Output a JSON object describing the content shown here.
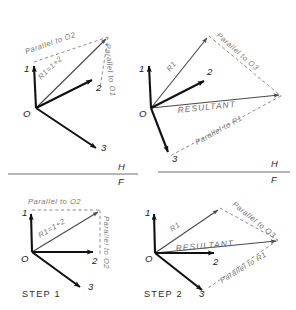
{
  "figure": {
    "panels": [
      {
        "id": "top-left",
        "name": "panel-top-left",
        "origin_label": "O",
        "vectors": [
          {
            "name": "vector-1",
            "label": "1"
          },
          {
            "name": "vector-2",
            "label": "2"
          },
          {
            "name": "vector-3",
            "label": "3"
          }
        ],
        "resultant_label": "R1=1+2",
        "construction_labels": [
          {
            "name": "parallel-to-o2",
            "text": "Parallel to  O2"
          },
          {
            "name": "parallel-to-o1",
            "text": "Parallel to O1"
          }
        ],
        "step_label": ""
      },
      {
        "id": "top-right",
        "name": "panel-top-right",
        "origin_label": "O",
        "vectors": [
          {
            "name": "vector-1",
            "label": "1"
          },
          {
            "name": "vector-2",
            "label": "2"
          },
          {
            "name": "vector-3",
            "label": "3"
          }
        ],
        "resultant_label": "RESULTANT",
        "r1_label": "R1",
        "construction_labels": [
          {
            "name": "parallel-to-o3",
            "text": "Parallel to O3"
          },
          {
            "name": "parallel-to-r1",
            "text": "Parallel to R1"
          }
        ],
        "step_label": ""
      },
      {
        "id": "bottom-left",
        "name": "panel-bottom-left",
        "origin_label": "O",
        "vectors": [
          {
            "name": "vector-1",
            "label": "1"
          },
          {
            "name": "vector-2",
            "label": "2"
          },
          {
            "name": "vector-3",
            "label": "3"
          }
        ],
        "resultant_label": "R1=1+2",
        "construction_labels": [
          {
            "name": "parallel-to-o2-top",
            "text": "Parallel  to  O2"
          },
          {
            "name": "parallel-to-o2-right",
            "text": "Parallel to O2"
          }
        ],
        "step_label": "STEP  1"
      },
      {
        "id": "bottom-right",
        "name": "panel-bottom-right",
        "origin_label": "O",
        "vectors": [
          {
            "name": "vector-1",
            "label": "1"
          },
          {
            "name": "vector-2",
            "label": "2"
          },
          {
            "name": "vector-3",
            "label": "3"
          }
        ],
        "resultant_label": "RESULTANT",
        "r1_label": "R1",
        "construction_labels": [
          {
            "name": "parallel-to-o3",
            "text": "Parallel to  O3"
          },
          {
            "name": "parallel-to-r1",
            "text": "Parallel to R1"
          }
        ],
        "step_label": "STEP  2"
      }
    ],
    "reference_line": {
      "name": "h-f-reference-line",
      "upper_label": "H",
      "lower_label": "F"
    },
    "colors": {
      "vector": "#111111",
      "construction": "#8c8c8c",
      "annotation": "#6e6e6e",
      "background": "#ffffff"
    }
  }
}
